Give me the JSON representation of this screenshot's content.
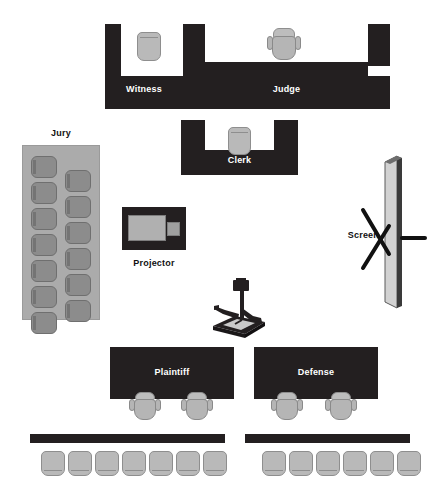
{
  "diagram": {
    "background_color": "#ffffff",
    "dark_color": "#231f20",
    "seat_color": "#b9b9b9",
    "jury_box_color": "#ababab",
    "jury_seat_color": "#8c8c8c"
  },
  "labels": {
    "witness": "Witness",
    "judge": "Judge",
    "clerk": "Clerk",
    "jury": "Jury",
    "projector": "Projector",
    "screen": "Screen",
    "plaintiff": "Plaintiff",
    "defense": "Defense"
  },
  "jury": {
    "left_column_seats": 7,
    "right_column_seats": 6,
    "total_seats": 13
  },
  "gallery": {
    "left_row_seats": 7,
    "right_row_seats": 6,
    "total_seats": 13
  },
  "counsel": {
    "plaintiff_chairs": 2,
    "defense_chairs": 2
  },
  "bench_seating": {
    "witness_chairs": 1,
    "judge_chairs": 1,
    "clerk_chairs": 1
  },
  "equipment": {
    "overhead_projector": "overhead-projector",
    "projector_cart": "projector",
    "projection_screen": "screen"
  }
}
